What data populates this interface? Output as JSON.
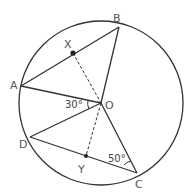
{
  "diagram": {
    "type": "circle-geometry",
    "colors": {
      "line": "#333333",
      "label": "#555555",
      "background": "#ffffff"
    },
    "circle": {
      "center": "O",
      "cx": 101,
      "cy": 103,
      "r": 82
    },
    "points": {
      "A": {
        "label": "A",
        "x": 21,
        "y": 86
      },
      "B": {
        "label": "B",
        "x": 119,
        "y": 27
      },
      "C": {
        "label": "C",
        "x": 137,
        "y": 173
      },
      "D": {
        "label": "D",
        "x": 30,
        "y": 137
      },
      "O": {
        "label": "O",
        "x": 101,
        "y": 103
      },
      "X": {
        "label": "X",
        "x": 73,
        "y": 53
      },
      "Y": {
        "label": "Y",
        "x": 86,
        "y": 156
      }
    },
    "segments": [
      "AB",
      "OA",
      "OB",
      "OC",
      "OD",
      "DC"
    ],
    "dashed_segments": [
      "XO",
      "OY"
    ],
    "angles": {
      "AOD": {
        "label": "30°"
      },
      "DCO": {
        "label": "50°"
      }
    }
  }
}
